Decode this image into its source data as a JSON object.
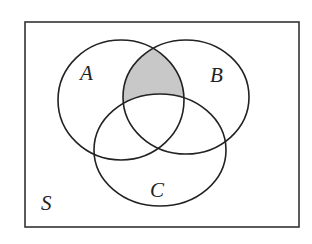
{
  "diagram": {
    "type": "venn",
    "universe": {
      "label": "S",
      "x": 25,
      "y": 22,
      "width": 274,
      "height": 205
    },
    "sets": [
      {
        "label": "A",
        "cx": 121,
        "cy": 100,
        "rx": 63,
        "ry": 60,
        "label_x": 88,
        "label_y": 80
      },
      {
        "label": "B",
        "cx": 186,
        "cy": 97,
        "rx": 63,
        "ry": 57,
        "label_x": 218,
        "label_y": 82
      },
      {
        "label": "C",
        "cx": 160,
        "cy": 150,
        "rx": 66,
        "ry": 56,
        "label_x": 158,
        "label_y": 197
      }
    ],
    "shaded_region": "A ∩ B ∩ C'",
    "colors": {
      "stroke": "#222222",
      "shade": "#c8c8c8",
      "background": "#ffffff"
    }
  }
}
